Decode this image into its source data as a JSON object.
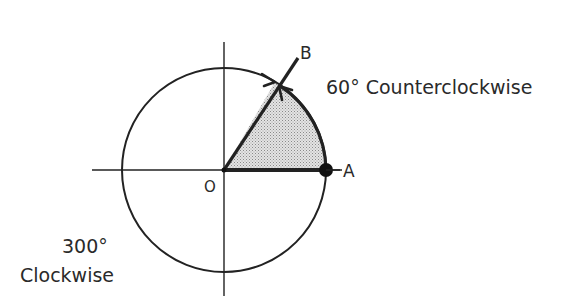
{
  "diagram": {
    "title": "",
    "labels": {
      "origin": "O",
      "point_a": "A",
      "point_b": "B",
      "ccw_angle": "60° Counterclockwise",
      "cw_angle_line1": "300°",
      "cw_angle_line2": "Clockwise"
    },
    "geometry": {
      "center": [
        224,
        170
      ],
      "radius": 102,
      "angle_ccw_deg": 60,
      "angle_cw_deg": 300
    },
    "colors": {
      "stroke": "#222222",
      "sector_fill": "#d6d6d6",
      "text": "#2a2a2a"
    }
  }
}
